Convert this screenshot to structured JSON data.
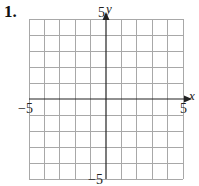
{
  "problem": {
    "number": "1."
  },
  "graph": {
    "type": "coordinate-grid",
    "x_range": [
      -5,
      5
    ],
    "y_range": [
      -5,
      5
    ],
    "grid_step": 1,
    "x_axis_label": "x",
    "y_axis_label": "y",
    "tick_labels": {
      "x_min": "−5",
      "x_max": "5",
      "y_min": "−5",
      "y_max": "5"
    },
    "colors": {
      "grid": "#a8a8a8",
      "axis": "#222222",
      "text": "#222222"
    }
  }
}
